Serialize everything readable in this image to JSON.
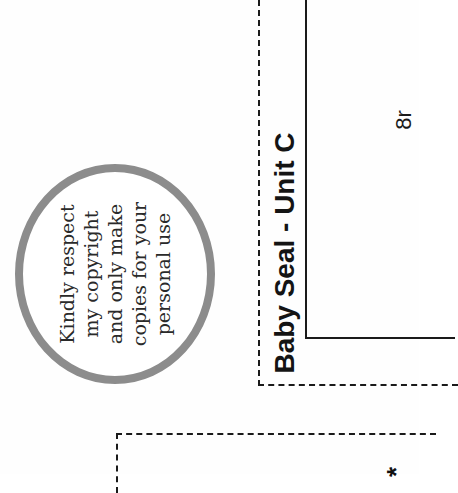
{
  "page": {
    "orientation": "rotated-90-ccw",
    "background": "#fefefe"
  },
  "copyright_seal": {
    "lines": [
      "Kindly respect",
      "my copyright",
      "and only make",
      "copies for your",
      "personal use"
    ],
    "ring_color": "#8c8c8c"
  },
  "pattern_piece": {
    "title": "Baby Seal - Unit C",
    "piece_label": "8r"
  },
  "second_piece": {
    "marker": "*"
  }
}
